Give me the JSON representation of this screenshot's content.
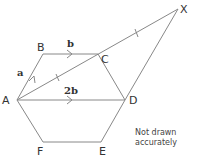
{
  "diagram": {
    "type": "geometry-hexagon-vectors",
    "stroke_color": "#888888",
    "vertices": {
      "A": {
        "label": "A",
        "x": 17,
        "y": 100
      },
      "B": {
        "label": "B",
        "x": 43,
        "y": 54
      },
      "C": {
        "label": "C",
        "x": 98,
        "y": 54
      },
      "D": {
        "label": "D",
        "x": 125,
        "y": 100
      },
      "E": {
        "label": "E",
        "x": 101,
        "y": 142
      },
      "F": {
        "label": "F",
        "x": 43,
        "y": 142
      },
      "X": {
        "label": "X",
        "x": 178,
        "y": 9
      }
    },
    "vectors": {
      "AB": {
        "label": "a"
      },
      "BC": {
        "label": "b"
      },
      "AD": {
        "label": "2b"
      }
    },
    "note_line1": "Not drawn",
    "note_line2": "accurately"
  }
}
